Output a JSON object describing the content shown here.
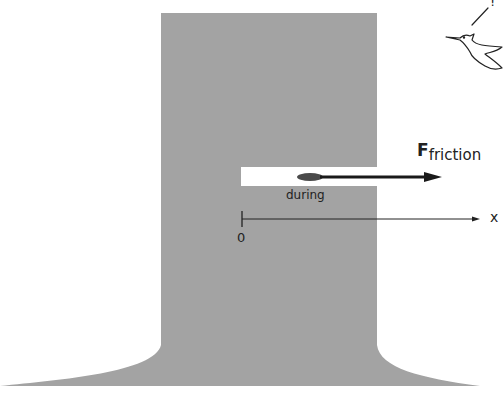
{
  "diagram": {
    "colors": {
      "tree": "#a3a3a3",
      "slot": "#ffffff",
      "ink": "#1a1a1a"
    },
    "labels": {
      "force_main": "F",
      "force_sub": "friction",
      "during": "during",
      "origin": "0",
      "axis": "x",
      "bird_exclaim": "!"
    }
  }
}
